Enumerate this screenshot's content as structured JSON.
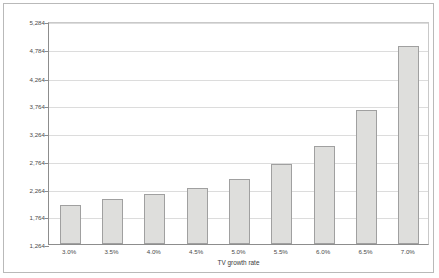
{
  "chart_data": {
    "type": "bar",
    "title": "",
    "xlabel": "TV growth rate",
    "ylabel": "",
    "categories": [
      "3.0%",
      "3.5%",
      "4.0%",
      "4.5%",
      "5.0%",
      "5.5%",
      "6.0%",
      "6.5%",
      "7.0%"
    ],
    "values": [
      1970,
      2075,
      2170,
      2280,
      2430,
      2700,
      3035,
      3685,
      4830
    ],
    "ylim": [
      1264,
      5284
    ],
    "ytick_step": 500,
    "ytick_labels": [
      "1,264",
      "1,764",
      "2,264",
      "2,764",
      "3,264",
      "3,764",
      "4,264",
      "4,784",
      "5,284"
    ],
    "ytick_values": [
      1264,
      1764,
      2264,
      2764,
      3264,
      3764,
      4264,
      4784,
      5284
    ],
    "grid": true,
    "legend": "none",
    "colors": {
      "bar_fill": "#dededc",
      "bar_border": "#a0a0a0",
      "axis": "#8d8d8d",
      "gridline": "#dcdcdc",
      "text": "#4a4a4a",
      "frame": "#b9b9b9",
      "background": "#ffffff"
    }
  }
}
